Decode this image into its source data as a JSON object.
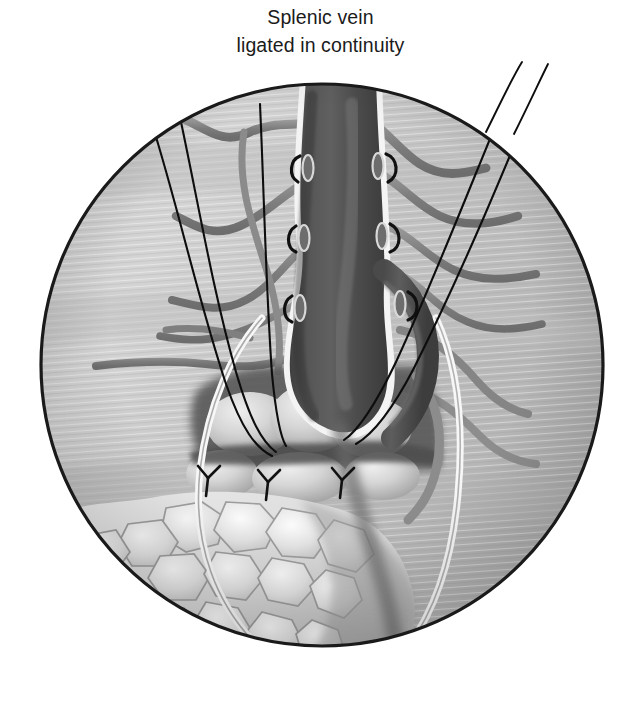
{
  "figure": {
    "title_line_1": "Splenic vein",
    "title_line_2": "ligated in continuity",
    "type": "medical-surgical-illustration",
    "view": "circular operative field inset",
    "canvas": {
      "width": 641,
      "height": 703
    },
    "circle_field": {
      "center_x": 322,
      "center_y": 365,
      "radius": 283,
      "border_color": "#1a1a1a",
      "border_width": 3
    },
    "palette": {
      "background": "#ffffff",
      "ink": "#1b1b1b",
      "field_tissue_light": "#d2d2d2",
      "field_tissue_mid": "#b9b9b9",
      "field_tissue_dark": "#9a9a9a",
      "vein_dark": "#4a4a4a",
      "vein_darkest": "#3a3a3a",
      "vein_highlight": "#f2f2f2",
      "branch_vessel": "#8a8a8a",
      "branch_vessel_dark": "#6f6f6f",
      "pancreas_lobule_light": "#e8e8e8",
      "pancreas_lobule_mid": "#c6c6c6",
      "pancreas_shadow": "#5c5c5c",
      "fat_light": "#ededed",
      "fat_outline": "#a8a8a8",
      "suture_thread": "#111111"
    },
    "structures": [
      {
        "name": "splenic-vein-trunk",
        "label": "Splenic vein",
        "shade": "dark-gray",
        "orientation": "vertical, entering from top of field"
      },
      {
        "name": "ligated-tributary-stumps",
        "label": "Ligated tributaries",
        "count": 6,
        "detail": "oval cut ends with tie knots along both sides of the vein"
      },
      {
        "name": "divided-branch-vessels",
        "label": "Divided branch vessels",
        "count": 8,
        "detail": "curved gray vessels retracting into surrounding tissue"
      },
      {
        "name": "pancreas-lobules",
        "label": "Pancreatic lobules",
        "count": 6
      },
      {
        "name": "retroperitoneal-fat",
        "label": "Fatty tissue",
        "detail": "cobblestone lobular fat filling lower-left of field"
      },
      {
        "name": "suture-threads",
        "label": "Traction sutures",
        "count": 5,
        "detail": "fine black threads running from the operative field out of the top-left and top-right"
      },
      {
        "name": "parenchymal-stitches",
        "label": "Parenchymal stitches",
        "count": 3
      }
    ],
    "annotation_count": 1
  }
}
